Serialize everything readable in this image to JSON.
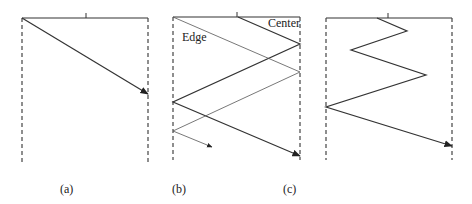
{
  "diagram": {
    "panels": [
      {
        "id": "a",
        "caption": "(a)",
        "left_x": 22,
        "right_x": 148,
        "top_y": 18,
        "bottom_y": 162,
        "tick_x": 86,
        "paths": [
          {
            "name": "ray",
            "points": [
              [
                22,
                18
              ],
              [
                148,
                94
              ]
            ],
            "arrow": true,
            "style": "solid"
          }
        ]
      },
      {
        "id": "b",
        "caption": "(b)",
        "left_x": 173,
        "right_x": 300,
        "top_y": 17,
        "bottom_y": 160,
        "tick_x": 237,
        "labels": [
          {
            "text": "Center",
            "x": 268,
            "y": 16
          },
          {
            "text": "Edge",
            "x": 182,
            "y": 31
          }
        ],
        "paths": [
          {
            "name": "center-ray",
            "points": [
              [
                238,
                17
              ],
              [
                300,
                44
              ],
              [
                173,
                102
              ],
              [
                300,
                156
              ]
            ],
            "arrow": true,
            "style": "solid"
          },
          {
            "name": "edge-ray",
            "points": [
              [
                173,
                17
              ],
              [
                300,
                72
              ],
              [
                173,
                131
              ],
              [
                212,
                147
              ]
            ],
            "arrow": true,
            "style": "thin"
          }
        ]
      },
      {
        "id": "c",
        "caption": "(c)",
        "left_x": 326,
        "right_x": 452,
        "top_y": 18,
        "bottom_y": 160,
        "tick_x": 388,
        "paths": [
          {
            "name": "zigzag-ray",
            "points": [
              [
                377,
                18
              ],
              [
                407,
                31
              ],
              [
                351,
                50
              ],
              [
                426,
                75
              ],
              [
                326,
                107
              ],
              [
                452,
                146
              ]
            ],
            "arrow": true,
            "style": "solid"
          }
        ]
      }
    ],
    "captions": [
      {
        "text": "(a)",
        "x": 60,
        "y": 183
      },
      {
        "text": "(b)",
        "x": 172,
        "y": 183
      },
      {
        "text": "(c)",
        "x": 283,
        "y": 183
      }
    ],
    "colors": {
      "line": "#333333",
      "thin": "#555555",
      "dash": "#444444"
    }
  }
}
